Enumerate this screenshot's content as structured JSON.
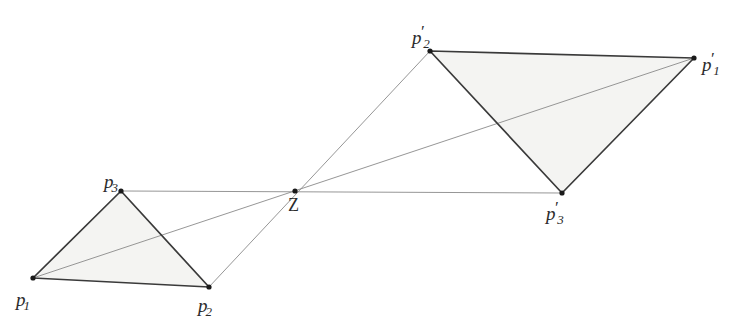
{
  "figure": {
    "clipped_header_text": "",
    "background_color": "#ffffff",
    "edge_color": "#3a3a3a",
    "ray_color": "#8a8a8a",
    "fill_color": "#f4f4f2",
    "vertex_color": "#1a1a1a",
    "label_color": "#2b2b2b"
  },
  "points": {
    "p1": {
      "label_base": "p",
      "label_sub": "1",
      "label_prime": "",
      "x": 33,
      "y": 278,
      "label_x": 16,
      "label_y": 285
    },
    "p2": {
      "label_base": "p",
      "label_sub": "2",
      "label_prime": "",
      "x": 209,
      "y": 287,
      "label_x": 198,
      "label_y": 291
    },
    "p3": {
      "label_base": "p",
      "label_sub": "3",
      "label_prime": "",
      "x": 121,
      "y": 191,
      "label_x": 104,
      "label_y": 167
    },
    "z": {
      "label_base": "Z",
      "label_sub": "",
      "label_prime": "",
      "x": 295,
      "y": 191,
      "label_x": 288,
      "label_y": 196
    },
    "p1p": {
      "label_base": "p",
      "label_sub": "1",
      "label_prime": "′",
      "x": 694,
      "y": 58,
      "label_x": 702,
      "label_y": 50
    },
    "p2p": {
      "label_base": "p",
      "label_sub": "2",
      "label_prime": "′",
      "x": 430,
      "y": 51,
      "label_x": 412,
      "label_y": 23
    },
    "p3p": {
      "label_base": "p",
      "label_sub": "3",
      "label_prime": "′",
      "x": 562,
      "y": 193,
      "label_x": 546,
      "label_y": 199
    }
  },
  "triangles": [
    {
      "name": "source-triangle",
      "vertices": [
        "p1",
        "p2",
        "p3"
      ]
    },
    {
      "name": "image-triangle",
      "vertices": [
        "p1p",
        "p2p",
        "p3p"
      ]
    }
  ],
  "projection_rays": [
    {
      "name": "ray-p1",
      "from": "p1",
      "through": "z",
      "to": "p1p"
    },
    {
      "name": "ray-p2",
      "from": "p2",
      "through": "z",
      "to": "p2p"
    },
    {
      "name": "ray-p3",
      "from": "p3",
      "through": "z",
      "to": "p3p"
    }
  ],
  "style": {
    "edge_width": 1.7,
    "ray_width": 0.9,
    "vertex_radius": 2.6
  }
}
